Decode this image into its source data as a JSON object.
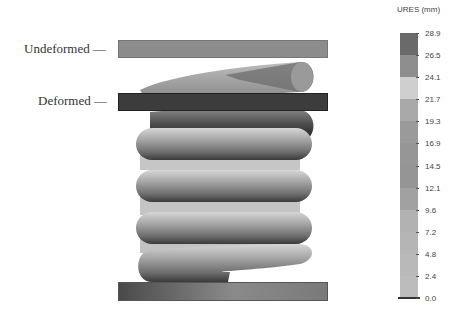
{
  "annotations": {
    "undeformed_label": "Undeformed —",
    "deformed_label": "Deformed —"
  },
  "plates": {
    "undeformed": {
      "color": "#8c8c8c"
    },
    "deformed": {
      "color": "#3c3c3c"
    },
    "base": {
      "color": "#707070"
    }
  },
  "legend": {
    "title": "URES (mm)",
    "ticks": [
      "28.9",
      "26.5",
      "24.1",
      "21.7",
      "19.3",
      "16.9",
      "14.5",
      "12.1",
      "9.6",
      "7.2",
      "4.8",
      "2.4",
      "0.0"
    ],
    "band_colors": [
      "#6a6a6a",
      "#8e8e8e",
      "#cfcfcf",
      "#a9a9a9",
      "#9a9a9a",
      "#969696",
      "#959595",
      "#a1a1a1",
      "#b2b2b2",
      "#b5b5b5",
      "#b9b9b9",
      "#bcbcbc"
    ]
  },
  "chart_data": {
    "type": "heatmap",
    "title": "URES (mm)",
    "colorbar": {
      "min": 0.0,
      "max": 28.9,
      "ticks": [
        28.9,
        26.5,
        24.1,
        21.7,
        19.3,
        16.9,
        14.5,
        12.1,
        9.6,
        7.2,
        4.8,
        2.4,
        0.0
      ],
      "unit": "mm"
    },
    "annotations": [
      "Undeformed",
      "Deformed"
    ]
  }
}
